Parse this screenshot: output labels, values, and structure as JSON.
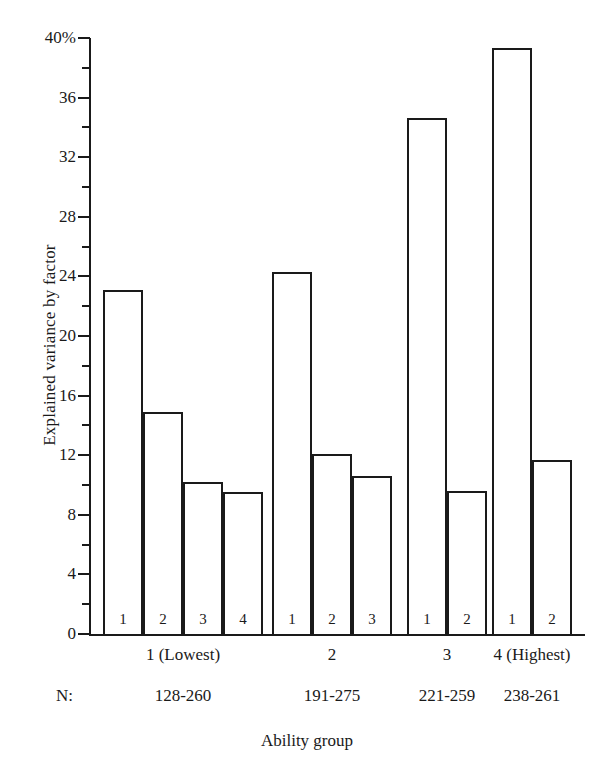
{
  "chart_data": {
    "type": "bar",
    "title": "",
    "xlabel": "Ability group",
    "ylabel": "Explained variance by factor",
    "ylim": [
      0,
      40
    ],
    "ytick_labels": [
      "40%",
      "36",
      "32",
      "28",
      "24",
      "20",
      "16",
      "12",
      "8",
      "4",
      "0"
    ],
    "ytick_values": [
      40,
      36,
      32,
      28,
      24,
      20,
      16,
      12,
      8,
      4,
      0
    ],
    "minor_tick_values": [
      38,
      34,
      30,
      26,
      22,
      18,
      14,
      10,
      6,
      2
    ],
    "grid": false,
    "legend": "none",
    "categories": [
      "1 (Lowest)",
      "2",
      "3",
      "4 (Highest)"
    ],
    "groups": [
      {
        "label": "1 (Lowest)",
        "n": "128-260",
        "bars": [
          {
            "factor": "1",
            "value": 23.1
          },
          {
            "factor": "2",
            "value": 14.9
          },
          {
            "factor": "3",
            "value": 10.2
          },
          {
            "factor": "4",
            "value": 9.5
          }
        ]
      },
      {
        "label": "2",
        "n": "191-275",
        "bars": [
          {
            "factor": "1",
            "value": 24.3
          },
          {
            "factor": "2",
            "value": 12.1
          },
          {
            "factor": "3",
            "value": 10.6
          }
        ]
      },
      {
        "label": "3",
        "n": "221-259",
        "bars": [
          {
            "factor": "1",
            "value": 34.6
          },
          {
            "factor": "2",
            "value": 9.6
          }
        ]
      },
      {
        "label": "4 (Highest)",
        "n": "238-261",
        "bars": [
          {
            "factor": "1",
            "value": 39.3
          },
          {
            "factor": "2",
            "value": 11.7
          }
        ]
      }
    ]
  },
  "axis": {
    "n_prefix": "N:"
  },
  "colors": {
    "ink": "#1a1a1a",
    "bar_fill": "#ffffff",
    "background": "#ffffff"
  }
}
